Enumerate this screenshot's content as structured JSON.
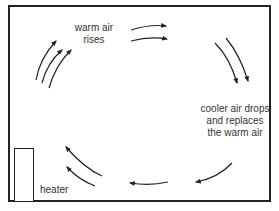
{
  "diagram": {
    "labels": {
      "warm_air_line1": "warm air",
      "warm_air_line2": "rises",
      "cooler_line1": "cooler air drops",
      "cooler_line2": "and replaces",
      "cooler_line3": "the warm air",
      "heater": "heater"
    },
    "colors": {
      "stroke": "#222222",
      "text": "#333333",
      "background": "#ffffff"
    }
  }
}
